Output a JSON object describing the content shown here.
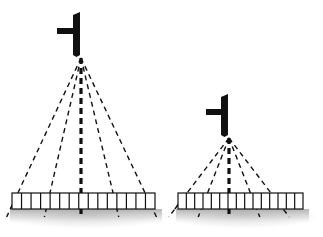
{
  "figure": {
    "type": "diagram",
    "title": "",
    "background_color": "#ffffff",
    "width": 323,
    "height": 237,
    "stroke_color": "#111111",
    "shadow_color": "#b8b8b8"
  },
  "assemblies": [
    {
      "id": "left-assembly",
      "name": "tall-sensor-assembly",
      "label": "",
      "mast": {
        "name": "sensor-mast",
        "x": 80,
        "top_y": 12,
        "bottom_y": 57,
        "width": 7,
        "color": "#111111"
      },
      "crossbar": {
        "name": "sensor-crossbar",
        "x_start": 57,
        "x_end": 80,
        "y": 31,
        "thickness": 6,
        "color": "#111111"
      },
      "apex": {
        "x": 81,
        "y": 58
      },
      "rays": {
        "count": 5,
        "color": "#111111",
        "dash": "5,4",
        "center_index": 2,
        "center_width": 3.2,
        "side_width": 1.4,
        "endpoints_x": [
          16,
          49,
          81,
          114,
          147
        ],
        "end_y": 197,
        "overshoot_y": 217
      },
      "bar": {
        "name": "segmented-measurement-bar",
        "x": 12,
        "y": 193,
        "width": 143,
        "height": 16,
        "segments": 15,
        "fill": "#ffffff",
        "stroke": "#111111",
        "stroke_width": 1.2
      },
      "shadow": {
        "x": 10,
        "y": 209,
        "width": 152,
        "height": 16
      }
    },
    {
      "id": "right-assembly",
      "name": "short-sensor-assembly",
      "label": "",
      "mast": {
        "name": "sensor-mast",
        "x": 228,
        "top_y": 94,
        "bottom_y": 137,
        "width": 7,
        "color": "#111111"
      },
      "crossbar": {
        "name": "sensor-crossbar",
        "x_start": 206,
        "x_end": 228,
        "y": 112,
        "thickness": 6,
        "color": "#111111"
      },
      "apex": {
        "x": 229,
        "y": 138
      },
      "rays": {
        "count": 5,
        "color": "#111111",
        "dash": "5,4",
        "center_index": 2,
        "center_width": 3.2,
        "side_width": 1.4,
        "endpoints_x": [
          184,
          206,
          229,
          252,
          274
        ],
        "end_y": 197,
        "overshoot_y": 217
      },
      "bar": {
        "name": "segmented-measurement-bar",
        "x": 178,
        "y": 193,
        "width": 125,
        "height": 16,
        "segments": 15,
        "fill": "#ffffff",
        "stroke": "#111111",
        "stroke_width": 1.2
      },
      "shadow": {
        "x": 176,
        "y": 209,
        "width": 133,
        "height": 16
      }
    }
  ]
}
